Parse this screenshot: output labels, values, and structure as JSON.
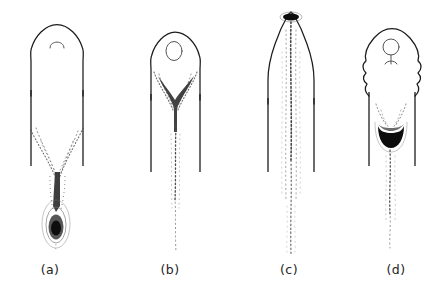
{
  "figure": {
    "kind": "line-drawing",
    "background_color": "#ffffff",
    "ink_color": "#1c1c1c",
    "stipple_color": "#3a3a3a",
    "width": 447,
    "height": 297,
    "panels": [
      {
        "id": "a",
        "caption": "(a)",
        "caption_x": 50,
        "caption_y": 274,
        "tip_style": "rounded-dome",
        "inner_mark": "small-arch",
        "plume_style": "converging-V-with-teardrop",
        "plume_terminus": "dark-teardrop-with-halo",
        "body_center_x": 57,
        "body_top_y": 24,
        "wall_bottom_y": 166,
        "plume_bottom_y": 250
      },
      {
        "id": "b",
        "caption": "(b)",
        "caption_x": 170,
        "caption_y": 274,
        "tip_style": "rounded-dome-with-shoulders",
        "inner_mark": "oval-ring",
        "plume_style": "dark-wedge-then-narrow-trail",
        "plume_terminus": "fading-stipple",
        "body_center_x": 175,
        "body_top_y": 32,
        "wall_bottom_y": 172,
        "plume_bottom_y": 252
      },
      {
        "id": "c",
        "caption": "(c)",
        "caption_x": 289,
        "caption_y": 274,
        "tip_style": "pointed-cone",
        "inner_mark": "dark-ellipse-at-apex",
        "plume_style": "straight-continuous-jet",
        "plume_terminus": "fading-stipple",
        "body_center_x": 291,
        "body_top_y": 12,
        "wall_bottom_y": 172,
        "plume_bottom_y": 254
      },
      {
        "id": "d",
        "caption": "(d)",
        "caption_x": 396,
        "caption_y": 274,
        "tip_style": "lobed-scalloped-dome",
        "inner_mark": "circle-with-stem",
        "plume_style": "dark-bowl-then-trail",
        "plume_terminus": "fading-stipple",
        "body_center_x": 392,
        "body_top_y": 28,
        "wall_bottom_y": 166,
        "plume_bottom_y": 248
      }
    ]
  }
}
